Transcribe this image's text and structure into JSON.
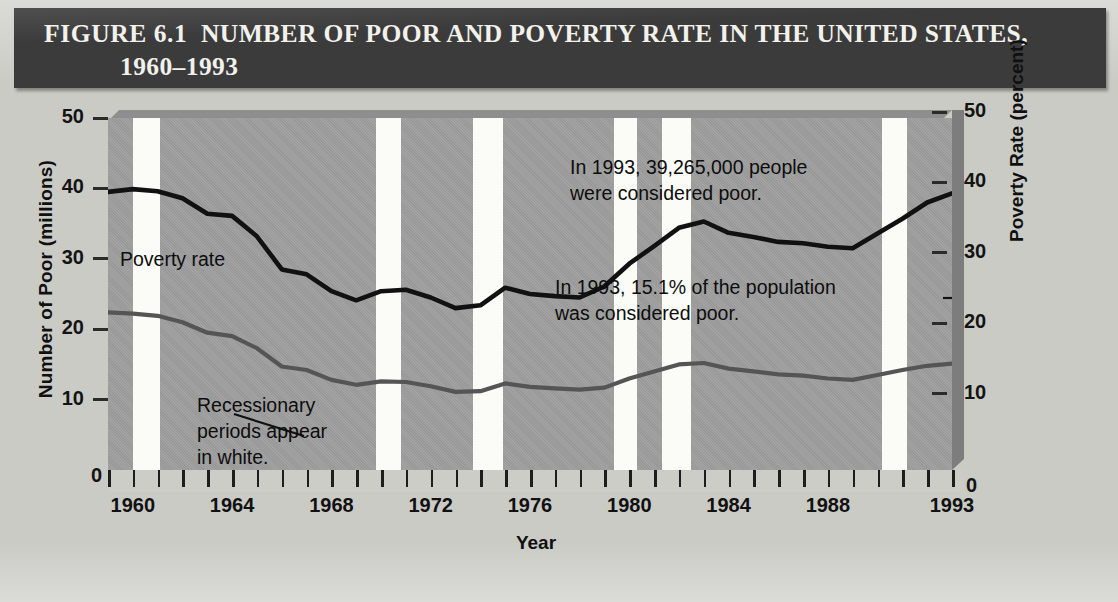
{
  "figure": {
    "label": "FIGURE 6.1",
    "title_line1": "NUMBER OF POOR AND POVERTY RATE IN THE UNITED STATES,",
    "title_line2": "1960–1993"
  },
  "colors": {
    "banner": "#3b3b3b",
    "banner_text": "#f2f1ec",
    "plot_bg": "#9e9e9e",
    "recession_band": "#fbfbf8",
    "number_of_poor_line": "#111111",
    "poverty_rate_line": "#555555",
    "page_bg": "#cbcbc6"
  },
  "axes": {
    "left_title": "Number of Poor (millions)",
    "right_title": "Poverty Rate (percent)",
    "x_title": "Year",
    "left_ticks": [
      "0",
      "10",
      "20",
      "30",
      "40",
      "50"
    ],
    "right_ticks": [
      "0",
      "10",
      "20",
      "30",
      "40",
      "50"
    ],
    "x_labels": [
      "1960",
      "1964",
      "1968",
      "1972",
      "1976",
      "1980",
      "1984",
      "1988",
      "1993"
    ]
  },
  "annotations": {
    "series_label": "Poverty rate",
    "recession_note": "Recessionary\nperiods appear\nin white.",
    "count_note": "In 1993, 39,265,000 people\nwere considered poor.",
    "rate_note": "In 1993, 15.1% of the population\nwas considered poor."
  },
  "chart_data": {
    "type": "line",
    "xlabel": "Year",
    "ylabel": "Number of Poor (millions)",
    "y2label": "Poverty Rate (percent)",
    "xlim": [
      1959,
      1993
    ],
    "ylim": [
      0,
      50
    ],
    "y2lim": [
      0,
      50
    ],
    "grid": false,
    "legend": "inline-labels",
    "x": [
      1959,
      1960,
      1961,
      1962,
      1963,
      1964,
      1965,
      1966,
      1967,
      1968,
      1969,
      1970,
      1971,
      1972,
      1973,
      1974,
      1975,
      1976,
      1977,
      1978,
      1979,
      1980,
      1981,
      1982,
      1983,
      1984,
      1985,
      1986,
      1987,
      1988,
      1989,
      1990,
      1991,
      1992,
      1993
    ],
    "series": [
      {
        "name": "Number of Poor (millions)",
        "axis": "left",
        "color": "#111111",
        "values": [
          39.5,
          39.9,
          39.6,
          38.6,
          36.4,
          36.1,
          33.2,
          28.5,
          27.8,
          25.4,
          24.1,
          25.4,
          25.6,
          24.5,
          23.0,
          23.4,
          25.9,
          25.0,
          24.7,
          24.5,
          26.1,
          29.3,
          31.8,
          34.4,
          35.3,
          33.7,
          33.1,
          32.4,
          32.2,
          31.7,
          31.5,
          33.6,
          35.7,
          38.0,
          39.3
        ]
      },
      {
        "name": "Poverty Rate (percent)",
        "axis": "right",
        "color": "#555555",
        "values": [
          22.4,
          22.2,
          21.9,
          21.0,
          19.5,
          19.0,
          17.3,
          14.7,
          14.2,
          12.8,
          12.1,
          12.6,
          12.5,
          11.9,
          11.1,
          11.2,
          12.3,
          11.8,
          11.6,
          11.4,
          11.7,
          13.0,
          14.0,
          15.0,
          15.2,
          14.4,
          14.0,
          13.6,
          13.4,
          13.0,
          12.8,
          13.5,
          14.2,
          14.8,
          15.1
        ]
      }
    ],
    "recession_bands": [
      {
        "start": 1960.0,
        "end": 1961.1
      },
      {
        "start": 1969.8,
        "end": 1970.8
      },
      {
        "start": 1973.7,
        "end": 1974.9
      },
      {
        "start": 1979.4,
        "end": 1980.3
      },
      {
        "start": 1981.3,
        "end": 1982.5
      },
      {
        "start": 1990.2,
        "end": 1991.2
      }
    ]
  }
}
